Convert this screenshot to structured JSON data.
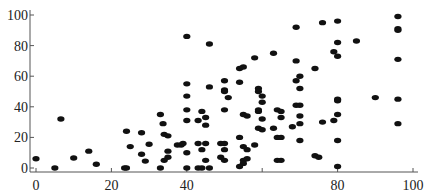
{
  "chart_data": {
    "type": "scatter",
    "title": "",
    "xlabel": "",
    "ylabel": "",
    "xlim": [
      0,
      100
    ],
    "ylim": [
      0,
      100
    ],
    "grid": false,
    "legend": "none",
    "xticks": [
      {
        "value": 0,
        "label": "0"
      },
      {
        "value": 20,
        "label": "20"
      },
      {
        "value": 40,
        "label": "40"
      },
      {
        "value": 60,
        "label": ""
      },
      {
        "value": 80,
        "label": "80"
      },
      {
        "value": 100,
        "label": "100"
      }
    ],
    "yticks": [
      {
        "value": 0,
        "label": "0"
      },
      {
        "value": 20,
        "label": "20"
      },
      {
        "value": 40,
        "label": "40"
      },
      {
        "value": 60,
        "label": "60"
      },
      {
        "value": 80,
        "label": "80"
      },
      {
        "value": 100,
        "label": "100"
      }
    ],
    "marker_color": "#111111",
    "points": [
      [
        0,
        6
      ],
      [
        5,
        0
      ],
      [
        6.6,
        32
      ],
      [
        10,
        6.5
      ],
      [
        14,
        11
      ],
      [
        16,
        2.5
      ],
      [
        23.5,
        0
      ],
      [
        24,
        0
      ],
      [
        24,
        24
      ],
      [
        25,
        14
      ],
      [
        28,
        23
      ],
      [
        28,
        9
      ],
      [
        29,
        4.5
      ],
      [
        30,
        15.5
      ],
      [
        33,
        35
      ],
      [
        33.7,
        29
      ],
      [
        34,
        22
      ],
      [
        35,
        21
      ],
      [
        33,
        0
      ],
      [
        35,
        11
      ],
      [
        35,
        7
      ],
      [
        34,
        5
      ],
      [
        37.5,
        15
      ],
      [
        38.5,
        15
      ],
      [
        40,
        38
      ],
      [
        40,
        31
      ],
      [
        40,
        10
      ],
      [
        43,
        16
      ],
      [
        40,
        0
      ],
      [
        43,
        0
      ],
      [
        44,
        0
      ],
      [
        46,
        0
      ],
      [
        40,
        86
      ],
      [
        46,
        81
      ],
      [
        40,
        55
      ],
      [
        46,
        53
      ],
      [
        40,
        47
      ],
      [
        50,
        50
      ],
      [
        51,
        46
      ],
      [
        50,
        38
      ],
      [
        44,
        37
      ],
      [
        43,
        31
      ],
      [
        45,
        33
      ],
      [
        45,
        28
      ],
      [
        55,
        35
      ],
      [
        56,
        34
      ],
      [
        59,
        37
      ],
      [
        59,
        26
      ],
      [
        39,
        16
      ],
      [
        45,
        16
      ],
      [
        44,
        12
      ],
      [
        49,
        16
      ],
      [
        50,
        16
      ],
      [
        50,
        12
      ],
      [
        54,
        20
      ],
      [
        55,
        14
      ],
      [
        56,
        12
      ],
      [
        49,
        7
      ],
      [
        45,
        5
      ],
      [
        50,
        5
      ],
      [
        55,
        5
      ],
      [
        55,
        3
      ],
      [
        54,
        1
      ],
      [
        58,
        15
      ],
      [
        50,
        57
      ],
      [
        54,
        56
      ],
      [
        54,
        65
      ],
      [
        55,
        66
      ],
      [
        58,
        72
      ],
      [
        50,
        51
      ],
      [
        59,
        52
      ],
      [
        59,
        50
      ],
      [
        60,
        47
      ],
      [
        60,
        43
      ],
      [
        59,
        38
      ],
      [
        60,
        32
      ],
      [
        60,
        25
      ],
      [
        63,
        75
      ],
      [
        69,
        92
      ],
      [
        76,
        95
      ],
      [
        80,
        96
      ],
      [
        80,
        82
      ],
      [
        79,
        76
      ],
      [
        80,
        73
      ],
      [
        69,
        70
      ],
      [
        74,
        65
      ],
      [
        69,
        57
      ],
      [
        70,
        60
      ],
      [
        70,
        52
      ],
      [
        80,
        44
      ],
      [
        64,
        38
      ],
      [
        65,
        37
      ],
      [
        65,
        33
      ],
      [
        69,
        41
      ],
      [
        70,
        41
      ],
      [
        70,
        34
      ],
      [
        70,
        29
      ],
      [
        68,
        27
      ],
      [
        63,
        26
      ],
      [
        76,
        30
      ],
      [
        79,
        31
      ],
      [
        80,
        35
      ],
      [
        80,
        45
      ],
      [
        64,
        20
      ],
      [
        65,
        20
      ],
      [
        70,
        18
      ],
      [
        80,
        18
      ],
      [
        56,
        6
      ],
      [
        65,
        5
      ],
      [
        64,
        5
      ],
      [
        74,
        8
      ],
      [
        75,
        7
      ],
      [
        80,
        1
      ],
      [
        85,
        83
      ],
      [
        96,
        99
      ],
      [
        96,
        91
      ],
      [
        96,
        90
      ],
      [
        96,
        71
      ],
      [
        90,
        46
      ],
      [
        96,
        45
      ],
      [
        96,
        29
      ]
    ]
  }
}
